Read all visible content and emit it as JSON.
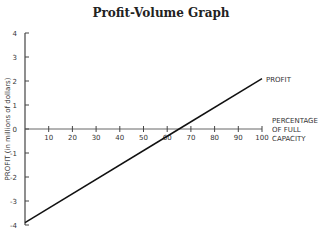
{
  "chart_data": {
    "type": "line",
    "title": "Profit-Volume Graph",
    "xlabel": "PERCENTAGE OF FULL CAPACITY",
    "ylabel": "PROFIT (in millions of dollars)",
    "x_ticks": [
      10,
      20,
      30,
      40,
      50,
      60,
      70,
      80,
      90,
      100
    ],
    "y_ticks": [
      4,
      3,
      2,
      1,
      0,
      -1,
      -2,
      -3,
      -4
    ],
    "xlim": [
      0,
      100
    ],
    "ylim": [
      -4,
      4
    ],
    "grid": false,
    "series": [
      {
        "name": "PROFIT",
        "x": [
          0,
          65,
          100
        ],
        "y": [
          -3.9,
          0,
          2.1
        ]
      }
    ],
    "annotations": [
      "PROFIT"
    ]
  },
  "labels": {
    "title": "Profit-Volume Graph",
    "ylabel": "PROFIT (in millions of dollars)",
    "xlabel_lines": [
      "PERCENTAGE",
      "OF FULL",
      "CAPACITY"
    ],
    "series_label": "PROFIT"
  }
}
